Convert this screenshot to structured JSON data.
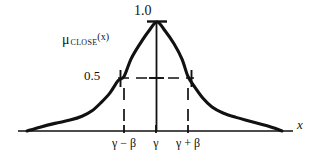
{
  "figure": {
    "background_color": "#ffffff",
    "ink_color": "#111111"
  },
  "labels": {
    "peak_value": "1.0",
    "half_value": "0.5",
    "function_symbol": "μ",
    "function_subscript": "CLOSE",
    "function_argument": "(x)",
    "axis_x": "x"
  },
  "tick_labels": [
    "γ − β",
    "γ",
    "γ + β"
  ],
  "chart_data": {
    "type": "line",
    "title": "",
    "xlabel": "x",
    "ylabel": "μ CLOSE (x)",
    "grid": false,
    "legend": false,
    "ylim": [
      0,
      1
    ],
    "y_tick_values": [
      0.5,
      1.0
    ],
    "y_tick_labels": [
      "0.5",
      "1.0"
    ],
    "x_tick_labels": [
      "γ − β",
      "γ",
      "γ + β"
    ],
    "x_tick_pixels": [
      124,
      156,
      188
    ],
    "annotations": [
      {
        "name": "peak-cap",
        "value": 1.0,
        "at": "γ",
        "style": "horizontal-tick"
      },
      {
        "name": "half-level-line",
        "value": 0.5,
        "style": "dashed-horizontal"
      },
      {
        "name": "left-halfwidth-drop",
        "at": "γ − β",
        "style": "dashed-vertical"
      },
      {
        "name": "right-halfwidth-drop",
        "at": "γ + β",
        "style": "dashed-vertical"
      },
      {
        "name": "center-axis",
        "at": "γ",
        "style": "solid-vertical"
      }
    ],
    "series": [
      {
        "name": "μ CLOSE (x)",
        "points": [
          [
            27,
            0.0
          ],
          [
            40,
            0.035
          ],
          [
            55,
            0.07
          ],
          [
            70,
            0.1
          ],
          [
            82,
            0.135
          ],
          [
            92,
            0.185
          ],
          [
            101,
            0.26
          ],
          [
            110,
            0.35
          ],
          [
            118,
            0.46
          ],
          [
            124,
            0.5
          ],
          [
            131,
            0.66
          ],
          [
            140,
            0.8
          ],
          [
            149,
            0.92
          ],
          [
            157,
            1.0
          ],
          [
            165,
            0.92
          ],
          [
            174,
            0.8
          ],
          [
            182,
            0.66
          ],
          [
            188,
            0.5
          ],
          [
            195,
            0.4
          ],
          [
            203,
            0.3
          ],
          [
            212,
            0.22
          ],
          [
            223,
            0.165
          ],
          [
            236,
            0.125
          ],
          [
            250,
            0.09
          ],
          [
            264,
            0.055
          ],
          [
            275,
            0.025
          ],
          [
            282,
            0.0
          ]
        ]
      }
    ]
  }
}
